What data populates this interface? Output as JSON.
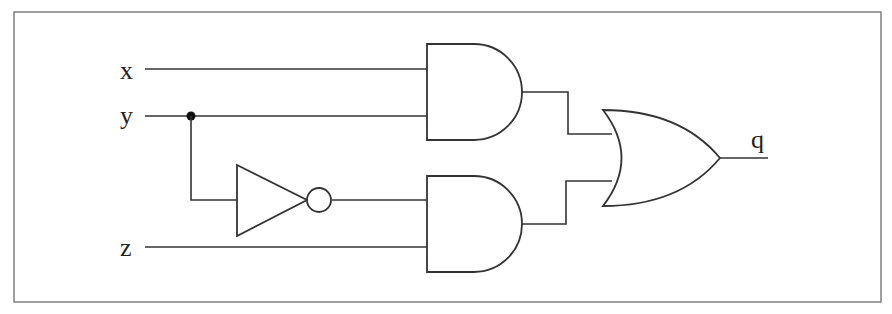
{
  "diagram": {
    "type": "logic-circuit",
    "inputs": [
      {
        "label": "x"
      },
      {
        "label": "y"
      },
      {
        "label": "z"
      }
    ],
    "output": {
      "label": "q"
    },
    "gates": [
      {
        "id": "and1",
        "type": "AND",
        "inputs": [
          "x",
          "y"
        ]
      },
      {
        "id": "not1",
        "type": "NOT",
        "inputs": [
          "y"
        ]
      },
      {
        "id": "and2",
        "type": "AND",
        "inputs": [
          "not1",
          "z"
        ]
      },
      {
        "id": "or1",
        "type": "OR",
        "inputs": [
          "and1",
          "and2"
        ],
        "output": "q"
      }
    ],
    "expression": "q = (x AND y) OR (NOT y AND z)",
    "colors": {
      "line": "#333333",
      "frame": "#777777",
      "background": "#ffffff"
    }
  }
}
